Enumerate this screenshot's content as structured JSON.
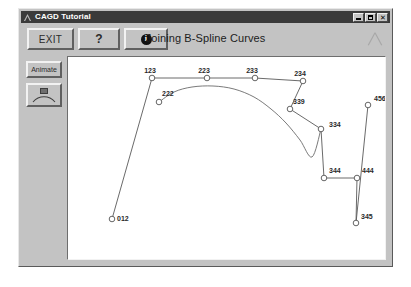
{
  "window": {
    "title": "CAGD Tutorial",
    "icon": "triangle-logo-icon",
    "buttons": {
      "minimize": "minimize-icon",
      "maximize": "maximize-icon",
      "close": "✕"
    }
  },
  "toolbar": {
    "exit_label": "EXIT",
    "help_label": "?",
    "info_label": "i",
    "title": "Joining B-Spline Curves",
    "logo": "triangle-logo-icon"
  },
  "sidebar": {
    "items": [
      {
        "label": "Animate",
        "name": "animate-button"
      },
      {
        "label": "",
        "name": "curve-tool-button"
      }
    ]
  },
  "chart_data": {
    "type": "scatter",
    "title": "Joining B-Spline Curves",
    "xlabel": "",
    "ylabel": "",
    "xlim": [
      0,
      322
    ],
    "ylim": [
      0,
      205
    ],
    "grid": false,
    "legend": null,
    "annotations": [
      {
        "label": "012",
        "x": 44,
        "y": 162,
        "label_dx": 5,
        "label_dy": 2
      },
      {
        "label": "123",
        "x": 84,
        "y": 21,
        "label_dx": -2,
        "label_dy": -5
      },
      {
        "label": "222",
        "x": 91,
        "y": 45,
        "label_dx": 3,
        "label_dy": -6
      },
      {
        "label": "223",
        "x": 139,
        "y": 21,
        "label_dx": -3,
        "label_dy": -5
      },
      {
        "label": "233",
        "x": 187,
        "y": 21,
        "label_dx": -3,
        "label_dy": -5
      },
      {
        "label": "234",
        "x": 235,
        "y": 24,
        "label_dx": -3,
        "label_dy": -5
      },
      {
        "label": "339",
        "x": 222,
        "y": 52,
        "label_dx": 3,
        "label_dy": -5
      },
      {
        "label": "334",
        "x": 253,
        "y": 72,
        "label_dx": 8,
        "label_dy": -2
      },
      {
        "label": "344",
        "x": 256,
        "y": 121,
        "label_dx": 5,
        "label_dy": -5
      },
      {
        "label": "444",
        "x": 289,
        "y": 121,
        "label_dx": 5,
        "label_dy": -5
      },
      {
        "label": "345",
        "x": 288,
        "y": 166,
        "label_dx": 5,
        "label_dy": -4
      },
      {
        "label": "456",
        "x": 300,
        "y": 48,
        "label_dx": 6,
        "label_dy": -4
      }
    ],
    "control_polygon": [
      [
        44,
        162
      ],
      [
        84,
        21
      ],
      [
        139,
        21
      ],
      [
        187,
        21
      ],
      [
        235,
        24
      ],
      [
        222,
        52
      ],
      [
        253,
        72
      ],
      [
        256,
        121
      ],
      [
        289,
        121
      ],
      [
        288,
        166
      ],
      [
        300,
        48
      ]
    ],
    "curve_points": [
      [
        91,
        45
      ],
      [
        106,
        35
      ],
      [
        124,
        30
      ],
      [
        145,
        29
      ],
      [
        166,
        32
      ],
      [
        186,
        40
      ],
      [
        203,
        52
      ],
      [
        218,
        66
      ],
      [
        232,
        83
      ],
      [
        244,
        100
      ],
      [
        253,
        72
      ]
    ]
  }
}
